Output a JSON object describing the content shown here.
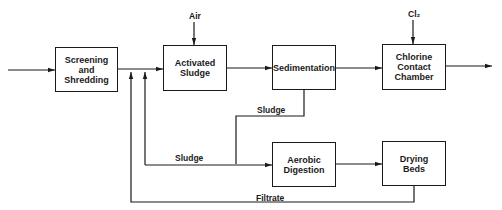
{
  "diagram": {
    "type": "process-flow",
    "nodes": [
      {
        "id": "screening",
        "label": "Screening and Shredding",
        "lines": [
          "Screening",
          "and",
          "Shredding"
        ]
      },
      {
        "id": "activated",
        "label": "Activated Sludge",
        "lines": [
          "Activated",
          "Sludge"
        ]
      },
      {
        "id": "sedimentation",
        "label": "Sedimentation",
        "lines": [
          "Sedimentation"
        ]
      },
      {
        "id": "chlorine",
        "label": "Chlorine Contact Chamber",
        "lines": [
          "Chlorine",
          "Contact",
          "Chamber"
        ]
      },
      {
        "id": "aerobic",
        "label": "Aerobic Digestion",
        "lines": [
          "Aerobic",
          "Digestion"
        ]
      },
      {
        "id": "drying",
        "label": "Drying Beds",
        "lines": [
          "Drying",
          "Beds"
        ]
      }
    ],
    "inputs": {
      "air": "Air",
      "cl2": "Cl₂"
    },
    "edge_labels": {
      "sludge_upper": "Sludge",
      "sludge_lower": "Sludge",
      "filtrate": "Filtrate"
    },
    "edges": [
      {
        "from": "influent",
        "to": "screening"
      },
      {
        "from": "screening",
        "to": "activated"
      },
      {
        "from": "air",
        "to": "activated"
      },
      {
        "from": "activated",
        "to": "sedimentation"
      },
      {
        "from": "sedimentation",
        "to": "chlorine"
      },
      {
        "from": "cl2",
        "to": "chlorine"
      },
      {
        "from": "chlorine",
        "to": "effluent"
      },
      {
        "from": "sedimentation",
        "to": "aerobic",
        "label": "Sludge"
      },
      {
        "from": "sedimentation",
        "to": "activated-inlet",
        "label": "Sludge (return)"
      },
      {
        "from": "aerobic",
        "to": "drying"
      },
      {
        "from": "drying",
        "to": "activated-inlet",
        "label": "Filtrate"
      }
    ]
  }
}
